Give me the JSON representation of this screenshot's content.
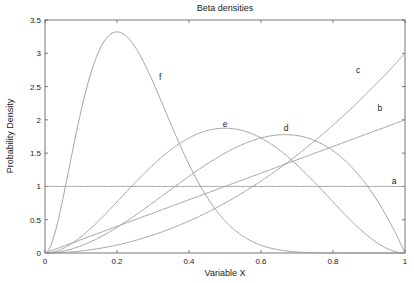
{
  "chart_data": {
    "type": "line",
    "title": "Beta densities",
    "xlabel": "Variable X",
    "ylabel": "Probability Density",
    "xlim": [
      0,
      1
    ],
    "ylim": [
      0,
      3.5
    ],
    "xticks": [
      "0",
      "0.2",
      "0.4",
      "0.6",
      "0.8",
      "1"
    ],
    "yticks": [
      "0",
      "0.5",
      "1",
      "1.5",
      "2",
      "2.5",
      "3",
      "3.5"
    ],
    "grid": false,
    "legend": "inline curve labels",
    "series": [
      {
        "name": "a",
        "distribution": "Beta(1,1)",
        "alpha": 1,
        "beta": 1,
        "label_pos": [
          0.97,
          1.03
        ]
      },
      {
        "name": "b",
        "distribution": "Beta(2,1)",
        "alpha": 2,
        "beta": 1,
        "label_pos": [
          0.93,
          2.13
        ]
      },
      {
        "name": "c",
        "distribution": "Beta(3,1)",
        "alpha": 3,
        "beta": 1,
        "label_pos": [
          0.87,
          2.7
        ]
      },
      {
        "name": "d",
        "distribution": "Beta(3,2)",
        "alpha": 3,
        "beta": 2,
        "label_pos": [
          0.67,
          1.83
        ]
      },
      {
        "name": "e",
        "distribution": "Beta(3,3)",
        "alpha": 3,
        "beta": 3,
        "label_pos": [
          0.5,
          1.9
        ]
      },
      {
        "name": "f",
        "distribution": "Beta(3,9)",
        "alpha": 3,
        "beta": 9,
        "label_pos": [
          0.32,
          2.6
        ]
      }
    ],
    "x": [
      0,
      0.1,
      0.2,
      0.3,
      0.4,
      0.5,
      0.6,
      0.7,
      0.8,
      0.9,
      1.0
    ],
    "values": {
      "a": [
        1,
        1,
        1,
        1,
        1,
        1,
        1,
        1,
        1,
        1,
        1
      ],
      "b": [
        0,
        0.2,
        0.4,
        0.6,
        0.8,
        1.0,
        1.2,
        1.4,
        1.6,
        1.8,
        2.0
      ],
      "c": [
        0,
        0.03,
        0.12,
        0.27,
        0.48,
        0.75,
        1.08,
        1.47,
        1.92,
        2.43,
        3.0
      ],
      "d": [
        0,
        0.108,
        0.384,
        0.756,
        1.152,
        1.5,
        1.728,
        1.764,
        1.536,
        0.972,
        0
      ],
      "e": [
        0,
        0.243,
        0.768,
        1.323,
        1.728,
        1.875,
        1.728,
        1.323,
        0.768,
        0.243,
        0
      ],
      "f": [
        0,
        2.13,
        3.32,
        2.58,
        1.33,
        0.48,
        0.12,
        0.02,
        0.0,
        0.0,
        0
      ]
    }
  }
}
